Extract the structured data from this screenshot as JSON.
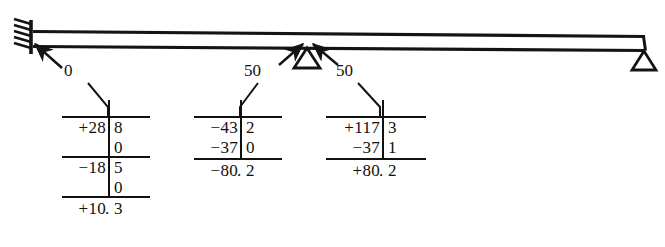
{
  "figure": {
    "ink_color": "#141414",
    "background": "#ffffff"
  },
  "beam": {
    "supports": [
      {
        "type": "fixed-support",
        "label": "fixed-end-left"
      },
      {
        "type": "roller-support",
        "label": "interior-roller"
      },
      {
        "type": "roller-support",
        "label": "end-roller-right"
      }
    ]
  },
  "callouts": [
    {
      "name": "callout-left",
      "label": "0"
    },
    {
      "name": "callout-middle-left",
      "label": "50"
    },
    {
      "name": "callout-middle-right",
      "label": "50"
    }
  ],
  "tables": [
    {
      "name": "moment-table-left",
      "rows": [
        {
          "sign": "+",
          "int": "28",
          "dec": "8"
        },
        {
          "sign": "",
          "int": "",
          "dec": "0"
        },
        {
          "sign": "−",
          "int": "18",
          "dec": "5"
        },
        {
          "sign": "",
          "int": "",
          "dec": "0"
        }
      ],
      "total": {
        "sign": "+",
        "int": "10",
        "dec": "3",
        "text": "+10.3"
      }
    },
    {
      "name": "moment-table-middle",
      "rows": [
        {
          "sign": "−",
          "int": "43",
          "dec": "2"
        },
        {
          "sign": "−",
          "int": "37",
          "dec": "0"
        }
      ],
      "total": {
        "sign": "−",
        "int": "80",
        "dec": "2",
        "text": "−80.2"
      }
    },
    {
      "name": "moment-table-right",
      "rows": [
        {
          "sign": "+",
          "int": "117",
          "dec": "3"
        },
        {
          "sign": "−",
          "int": "37",
          "dec": "1"
        }
      ],
      "total": {
        "sign": "+",
        "int": "80",
        "dec": "2",
        "text": "+80.2"
      }
    }
  ],
  "separator": "."
}
